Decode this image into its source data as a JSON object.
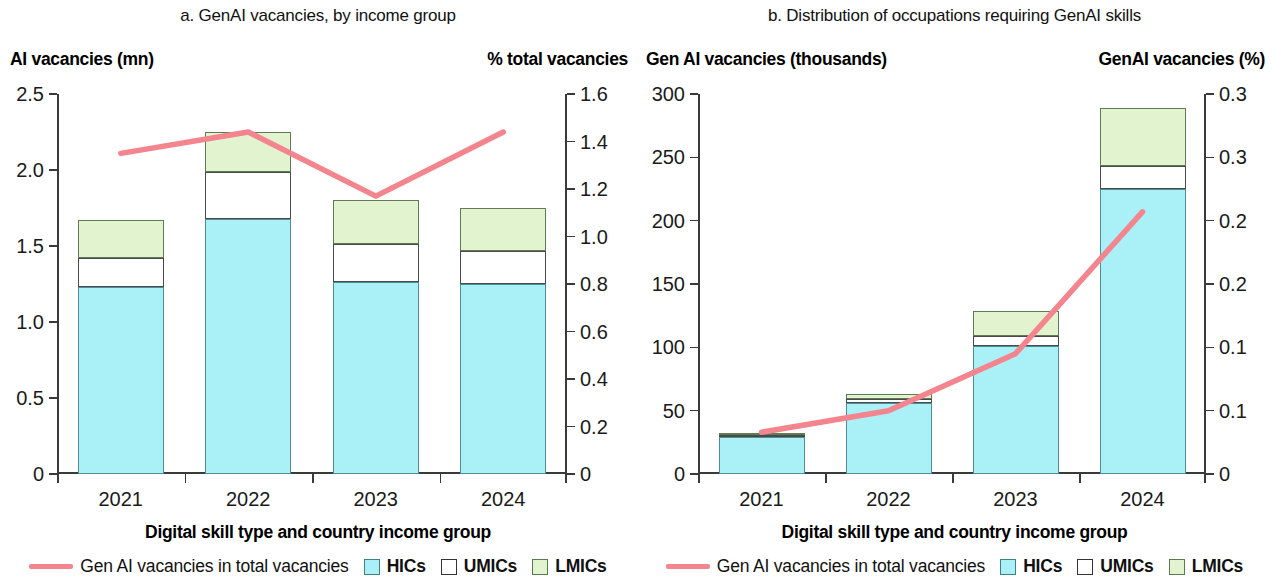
{
  "figure": {
    "panels": [
      {
        "id": "panel-a",
        "title": "a. GenAI vacancies, by income group",
        "left_axis_caption": "AI vacancies (mn)",
        "right_axis_caption": "% total vacancies",
        "x_axis_title": "Digital skill type and country income group",
        "legend": {
          "line_label": "Gen AI vacancies in total vacancies",
          "hics_label": "HICs",
          "umics_label": "UMICs",
          "lmics_label": "LMICs"
        }
      },
      {
        "id": "panel-b",
        "title": "b. Distribution of occupations requiring GenAI skills",
        "left_axis_caption": "Gen AI vacancies (thousands)",
        "right_axis_caption": "GenAI vacancies (%)",
        "x_axis_title": "Digital skill type and country income group",
        "legend": {
          "line_label": "Gen AI vacancies in total vacancies",
          "hics_label": "HICs",
          "umics_label": "UMICs",
          "lmics_label": "LMICs"
        }
      }
    ]
  },
  "colors": {
    "hics": "#aaf0f7",
    "umics": "#ffffff",
    "lmics": "#e2f4cf",
    "line": "#f4848e",
    "axis": "#3a3a3a",
    "text": "#111111"
  },
  "chart_data": [
    {
      "type": "bar",
      "id": "panel-a",
      "title": "a. GenAI vacancies, by income group",
      "subtitle": "",
      "xlabel": "Digital skill type and country income group",
      "ylabel": "AI vacancies (mn)",
      "y2label": "% total vacancies",
      "categories": [
        "2021",
        "2022",
        "2023",
        "2024"
      ],
      "ylim": [
        0,
        2.5
      ],
      "yticks": [
        0,
        0.5,
        1.0,
        1.5,
        2.0,
        2.5
      ],
      "ytick_labels": [
        "0",
        "0.5",
        "1.0",
        "1.5",
        "2.0",
        "2.5"
      ],
      "y2lim": [
        0,
        1.6
      ],
      "y2ticks": [
        0,
        0.2,
        0.4,
        0.6,
        0.8,
        1.0,
        1.2,
        1.4,
        1.6
      ],
      "y2tick_labels": [
        "0",
        "0.2",
        "0.4",
        "0.6",
        "0.8",
        "1.0",
        "1.2",
        "1.4",
        "1.6"
      ],
      "grid": false,
      "legend_position": "bottom",
      "stacked": true,
      "series": [
        {
          "name": "HICs",
          "type": "bar",
          "axis": "left",
          "values": [
            1.23,
            1.68,
            1.26,
            1.25
          ]
        },
        {
          "name": "UMICs",
          "type": "bar",
          "axis": "left",
          "values": [
            0.19,
            0.31,
            0.25,
            0.22
          ]
        },
        {
          "name": "LMICs",
          "type": "bar",
          "axis": "left",
          "values": [
            0.25,
            0.26,
            0.29,
            0.28
          ]
        },
        {
          "name": "Gen AI vacancies in total vacancies",
          "type": "line",
          "axis": "right",
          "values": [
            1.35,
            1.44,
            1.17,
            1.44
          ]
        }
      ],
      "totals": [
        1.67,
        2.25,
        1.8,
        1.75
      ]
    },
    {
      "type": "bar",
      "id": "panel-b",
      "title": "b. Distribution of occupations requiring GenAI skills",
      "subtitle": "",
      "xlabel": "Digital skill type and country income group",
      "ylabel": "Gen AI vacancies (thousands)",
      "y2label": "GenAI vacancies (%)",
      "categories": [
        "2021",
        "2022",
        "2023",
        "2024"
      ],
      "ylim": [
        0,
        300
      ],
      "yticks": [
        0,
        50,
        100,
        150,
        200,
        250,
        300
      ],
      "ytick_labels": [
        "0",
        "50",
        "100",
        "150",
        "200",
        "250",
        "300"
      ],
      "y2lim": [
        0,
        0.3
      ],
      "y2ticks": [
        0,
        0.05,
        0.1,
        0.15,
        0.2,
        0.25,
        0.3
      ],
      "y2tick_labels": [
        "0",
        "0.1",
        "0.1",
        "0.2",
        "0.2",
        "0.3"
      ],
      "grid": false,
      "legend_position": "bottom",
      "stacked": true,
      "series": [
        {
          "name": "HICs",
          "type": "bar",
          "axis": "left",
          "values": [
            29,
            56,
            101,
            225
          ]
        },
        {
          "name": "UMICs",
          "type": "bar",
          "axis": "left",
          "values": [
            1.5,
            3,
            8,
            18
          ]
        },
        {
          "name": "LMICs",
          "type": "bar",
          "axis": "left",
          "values": [
            1.5,
            4,
            20,
            46
          ]
        },
        {
          "name": "Gen AI vacancies in total vacancies",
          "type": "line",
          "axis": "right",
          "values": [
            0.033,
            0.05,
            0.095,
            0.207
          ]
        }
      ],
      "totals": [
        32,
        63,
        129,
        289
      ]
    }
  ]
}
